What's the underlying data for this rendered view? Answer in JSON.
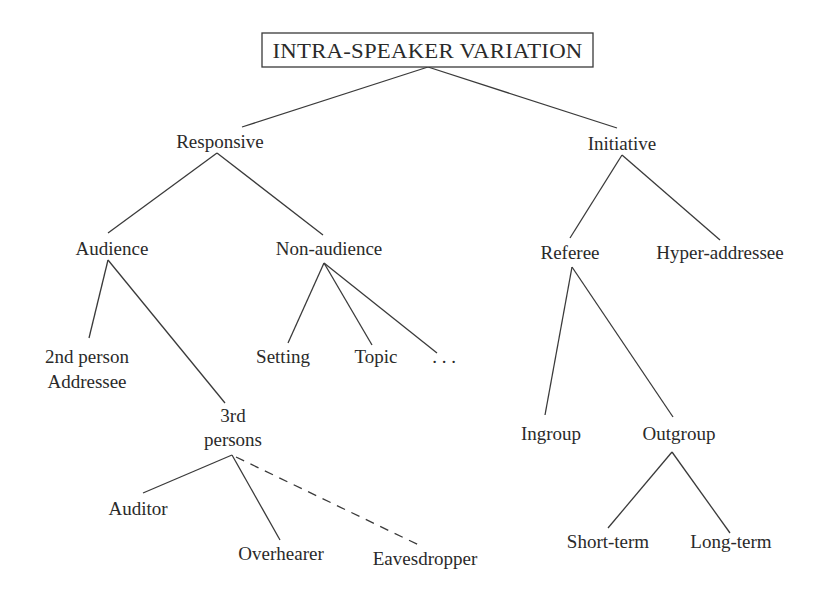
{
  "diagram": {
    "type": "tree",
    "root": {
      "id": "intra-speaker-variation",
      "label": "INTRA-SPEAKER VARIATION",
      "boxed": true
    },
    "nodes": {
      "responsive": {
        "label": "Responsive"
      },
      "initiative": {
        "label": "Initiative"
      },
      "audience": {
        "label": "Audience"
      },
      "non_audience": {
        "label": "Non-audience"
      },
      "referee": {
        "label": "Referee"
      },
      "hyper_addressee": {
        "label": "Hyper-addressee"
      },
      "second_person": {
        "line1": "2nd person",
        "line2": "Addressee"
      },
      "third_persons": {
        "line1": "3rd",
        "line2": "persons"
      },
      "setting": {
        "label": "Setting"
      },
      "topic": {
        "label": "Topic"
      },
      "ellipsis": {
        "label": ". . ."
      },
      "ingroup": {
        "label": "Ingroup"
      },
      "outgroup": {
        "label": "Outgroup"
      },
      "auditor": {
        "label": "Auditor"
      },
      "overhearer": {
        "label": "Overhearer"
      },
      "eavesdropper": {
        "label": "Eavesdropper"
      },
      "short_term": {
        "label": "Short-term"
      },
      "long_term": {
        "label": "Long-term"
      }
    },
    "edges": [
      {
        "from": "intra-speaker-variation",
        "to": "responsive",
        "style": "solid"
      },
      {
        "from": "intra-speaker-variation",
        "to": "initiative",
        "style": "solid"
      },
      {
        "from": "responsive",
        "to": "audience",
        "style": "solid"
      },
      {
        "from": "responsive",
        "to": "non_audience",
        "style": "solid"
      },
      {
        "from": "initiative",
        "to": "referee",
        "style": "solid"
      },
      {
        "from": "initiative",
        "to": "hyper_addressee",
        "style": "solid"
      },
      {
        "from": "audience",
        "to": "second_person",
        "style": "solid"
      },
      {
        "from": "audience",
        "to": "third_persons",
        "style": "solid"
      },
      {
        "from": "non_audience",
        "to": "setting",
        "style": "solid"
      },
      {
        "from": "non_audience",
        "to": "topic",
        "style": "solid"
      },
      {
        "from": "non_audience",
        "to": "ellipsis",
        "style": "solid"
      },
      {
        "from": "referee",
        "to": "ingroup",
        "style": "solid"
      },
      {
        "from": "referee",
        "to": "outgroup",
        "style": "solid"
      },
      {
        "from": "third_persons",
        "to": "auditor",
        "style": "solid"
      },
      {
        "from": "third_persons",
        "to": "overhearer",
        "style": "solid"
      },
      {
        "from": "third_persons",
        "to": "eavesdropper",
        "style": "dashed"
      },
      {
        "from": "outgroup",
        "to": "short_term",
        "style": "solid"
      },
      {
        "from": "outgroup",
        "to": "long_term",
        "style": "solid"
      }
    ]
  }
}
